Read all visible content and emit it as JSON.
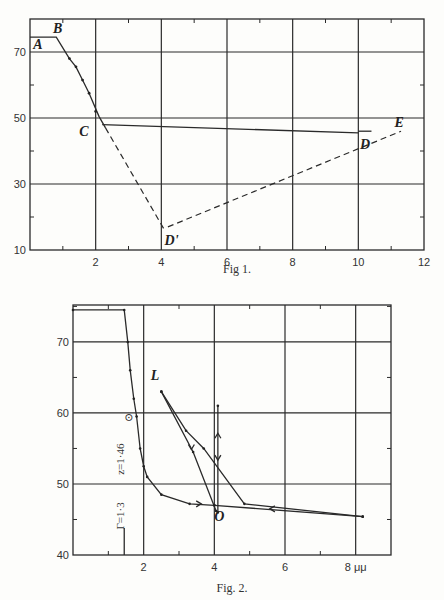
{
  "chart_data": [
    {
      "id": "fig1",
      "type": "line",
      "title": "",
      "caption": "Fig 1.",
      "xlabel": "",
      "ylabel": "",
      "xlim": [
        0,
        12
      ],
      "ylim": [
        10,
        80
      ],
      "xticks": [
        2,
        4,
        6,
        8,
        10,
        12
      ],
      "yticks": [
        10,
        30,
        50,
        70
      ],
      "xtick_labels": [
        "2",
        "4",
        "6",
        "8",
        "10",
        "12"
      ],
      "ytick_labels": [
        "10",
        "30",
        "50",
        "70"
      ],
      "xgrid": [
        2,
        4,
        6,
        8,
        10
      ],
      "ygrid": [
        30,
        50,
        70
      ],
      "grid": true,
      "series": [
        {
          "name": "A-B-C (solid)",
          "style": "solid",
          "points": [
            [
              0,
              74.5
            ],
            [
              0.8,
              74.5
            ],
            [
              1.2,
              68
            ],
            [
              1.4,
              65.5
            ],
            [
              1.6,
              61.5
            ],
            [
              1.8,
              57.5
            ],
            [
              2.1,
              50.5
            ],
            [
              2.3,
              47
            ]
          ]
        },
        {
          "name": "C-D (solid)",
          "style": "solid",
          "points": [
            [
              2.2,
              48
            ],
            [
              10.0,
              45.5
            ]
          ]
        },
        {
          "name": "D short bar",
          "style": "solid",
          "points": [
            [
              10.0,
              46
            ],
            [
              10.4,
              46
            ]
          ]
        },
        {
          "name": "C-D' (dashed)",
          "style": "dashed",
          "points": [
            [
              2.3,
              47
            ],
            [
              4.1,
              16
            ]
          ]
        },
        {
          "name": "D'-E (dashed)",
          "style": "dashed",
          "points": [
            [
              4.2,
              17
            ],
            [
              11.3,
              46
            ]
          ]
        }
      ],
      "markers": [
        [
          1.2,
          68
        ],
        [
          1.4,
          65.5
        ],
        [
          1.6,
          61.5
        ],
        [
          1.8,
          57.5
        ],
        [
          2.0,
          52
        ]
      ],
      "annotations": [
        {
          "text": "A",
          "x": 0.1,
          "y": 70.8
        },
        {
          "text": "B",
          "x": 0.7,
          "y": 75.8
        },
        {
          "text": "C",
          "x": 1.5,
          "y": 44.5
        },
        {
          "text": "D",
          "x": 10.05,
          "y": 40.5
        },
        {
          "text": "D'",
          "x": 4.1,
          "y": 11.5
        },
        {
          "text": "E",
          "x": 11.1,
          "y": 47.2
        }
      ]
    },
    {
      "id": "fig2",
      "type": "line",
      "title": "",
      "caption": "Fig. 2.",
      "xlabel": "",
      "ylabel": "",
      "x_unit": "μμ",
      "xlim": [
        0,
        9
      ],
      "ylim": [
        40,
        75.2
      ],
      "xticks": [
        2,
        4,
        6,
        8
      ],
      "yticks": [
        40,
        50,
        60,
        70
      ],
      "xtick_labels": [
        "2",
        "4",
        "6",
        "8 μμ"
      ],
      "ytick_labels": [
        "40",
        "50",
        "60",
        "70"
      ],
      "xgrid": [
        2,
        4,
        6,
        8
      ],
      "ygrid": [
        50,
        60,
        70
      ],
      "grid": true,
      "series": [
        {
          "name": "main curve",
          "style": "solid",
          "points": [
            [
              0,
              74.5
            ],
            [
              1.45,
              74.5
            ],
            [
              1.55,
              70
            ],
            [
              1.62,
              66
            ],
            [
              1.72,
              62
            ],
            [
              1.8,
              59.5
            ],
            [
              1.9,
              55
            ],
            [
              2.0,
              52.5
            ],
            [
              2.1,
              51
            ],
            [
              2.5,
              48.5
            ],
            [
              3.3,
              47.2
            ],
            [
              4.0,
              47
            ]
          ]
        },
        {
          "name": "L outer",
          "style": "solid",
          "points": [
            [
              2.5,
              63
            ],
            [
              3.2,
              57.5
            ],
            [
              3.7,
              55
            ],
            [
              4.85,
              47.2
            ],
            [
              8.2,
              45.4
            ]
          ]
        },
        {
          "name": "L inner",
          "style": "solid",
          "points": [
            [
              2.5,
              63
            ],
            [
              3.4,
              54.5
            ],
            [
              4.05,
              46.2
            ]
          ]
        },
        {
          "name": "O to right",
          "style": "solid",
          "points": [
            [
              4.0,
              47
            ],
            [
              8.2,
              45.4
            ]
          ]
        },
        {
          "name": "vertical at O",
          "style": "solid",
          "points": [
            [
              4.1,
              61
            ],
            [
              4.1,
              46
            ]
          ]
        }
      ],
      "arrows": [
        {
          "x": 3.6,
          "y": 47.2,
          "direction": "right"
        },
        {
          "x": 3.35,
          "y": 55,
          "direction": "down"
        },
        {
          "x": 5.6,
          "y": 46.5,
          "direction": "left"
        },
        {
          "x": 4.1,
          "y": 57,
          "direction": "up"
        },
        {
          "x": 4.1,
          "y": 53.5,
          "direction": "down"
        }
      ],
      "annotations": [
        {
          "text": "L",
          "x": 2.2,
          "y": 64.6
        },
        {
          "text": "O",
          "x": 4.0,
          "y": 44.8
        },
        {
          "text": "⊙",
          "x": 1.45,
          "y": 58.9
        },
        {
          "text": "Γ=1·3",
          "x": 1.45,
          "y": 45.5,
          "rotation": -90
        },
        {
          "text": "z=1·46",
          "x": 1.45,
          "y": 53.5,
          "rotation": -90
        }
      ]
    }
  ]
}
